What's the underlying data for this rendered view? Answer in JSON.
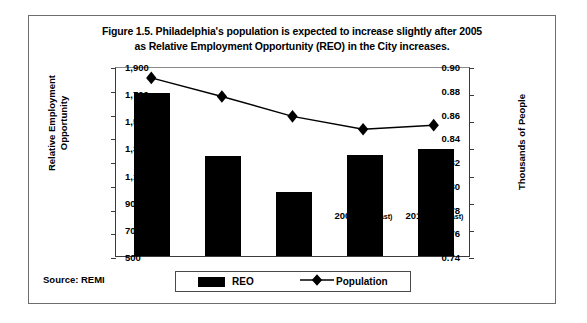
{
  "figure": {
    "title_line1": "Figure 1.5. Philadelphia's population is expected to increase slightly after 2005",
    "title_line2": "as Relative Employment Opportunity (REO) in the City increases.",
    "source_note": "Source: REMI"
  },
  "legend": {
    "reo_label": "REO",
    "population_label": "Population"
  },
  "chart_data": {
    "type": "bar",
    "title": "Figure 1.5. Philadelphia's population is expected to increase slightly after 2005 as Relative Employment Opportunity (REO) in the City increases.",
    "xlabel": "",
    "categories": [
      "1975",
      "1985",
      "1995",
      "2005",
      "2015"
    ],
    "category_labels": [
      "1975",
      "1985",
      "1995",
      "2005 (Forecast)",
      "2015 (Forecast)"
    ],
    "category_suffixes": [
      "",
      "",
      "",
      "(Forecast)",
      "(Forecast)"
    ],
    "grid": false,
    "legend_position": "bottom",
    "series": [
      {
        "name": "REO",
        "type": "bar",
        "axis": "left",
        "color": "#000000",
        "values": [
          0.877,
          0.824,
          0.794,
          0.825,
          0.83
        ]
      },
      {
        "name": "Population",
        "type": "line",
        "axis": "right",
        "color": "#000000",
        "marker": "diamond",
        "values": [
          1826,
          1688,
          1540,
          1444,
          1474
        ]
      }
    ],
    "axes": {
      "left": {
        "label_line1": "Relative Employment",
        "label_line2": "Opportunity",
        "label": "Relative Employment Opportunity",
        "min": 0.74,
        "max": 0.9,
        "step": 0.02,
        "ticks": [
          "0.90",
          "0.88",
          "0.86",
          "0.84",
          "0.82",
          "0.80",
          "0.78",
          "0.76",
          "0.74"
        ],
        "tick_values": [
          0.9,
          0.88,
          0.86,
          0.84,
          0.82,
          0.8,
          0.78,
          0.76,
          0.74
        ]
      },
      "right": {
        "label": "Thousands of People",
        "min": 500,
        "max": 1900,
        "step": 200,
        "ticks": [
          "1,900",
          "1,700",
          "1,500",
          "1,300",
          "1,100",
          "900",
          "700",
          "500"
        ],
        "tick_values": [
          1900,
          1700,
          1500,
          1300,
          1100,
          900,
          700,
          500
        ]
      }
    }
  }
}
